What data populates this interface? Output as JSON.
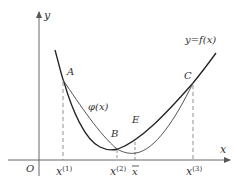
{
  "diagram": {
    "axes": {
      "x_label": "x",
      "y_label": "y",
      "origin_label": "O"
    },
    "curves": {
      "f_label": "y=f(x)",
      "phi_label": "φ(x)"
    },
    "points": {
      "A": "A",
      "B": "B",
      "C": "C",
      "E": "E"
    },
    "ticks": {
      "x1_base": "x",
      "x1_sup": "(1)",
      "x2_base": "x",
      "x2_sup": "(2)",
      "xbar": "x",
      "x3_base": "x",
      "x3_sup": "(3)"
    },
    "colors": {
      "f_curve": "#222222",
      "phi_curve": "#555555",
      "axis": "#555555",
      "dashed": "#777777"
    }
  }
}
